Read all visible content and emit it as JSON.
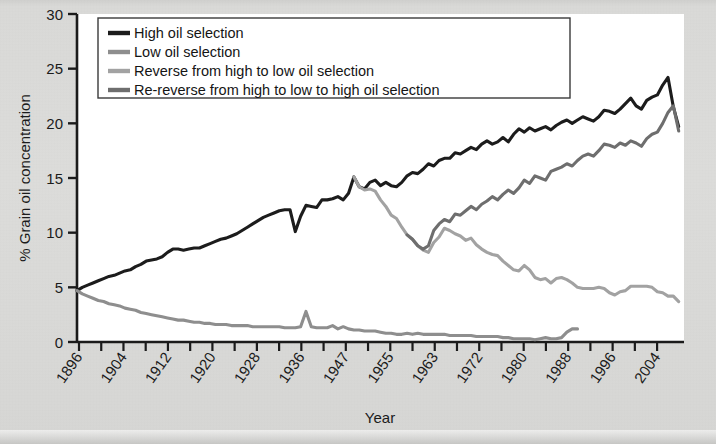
{
  "figure": {
    "background_color": "#d9d9d7",
    "plot_background_color": "#ffffff",
    "axis_color": "#1b1b1b"
  },
  "chart_data": {
    "type": "line",
    "title": "",
    "xlabel": "Year",
    "ylabel": "% Grain oil concentration",
    "xlim": [
      1896,
      2010
    ],
    "ylim": [
      0,
      30
    ],
    "yticks": [
      0,
      5,
      10,
      15,
      20,
      25,
      30
    ],
    "xticks": [
      1896,
      1904,
      1912,
      1920,
      1928,
      1936,
      1947,
      1955,
      1963,
      1972,
      1980,
      1988,
      1996,
      2004
    ],
    "grid": false,
    "legend_position": "top-left",
    "colors": {
      "high_oil_selection": "#1c1c1c",
      "low_oil_selection": "#8e8e8e",
      "reverse_high_to_low": "#a2a2a2",
      "re_reverse_high_low_high": "#6e6e6e"
    },
    "series": [
      {
        "name": "High oil selection",
        "color": "#1c1c1c",
        "stroke_width": 3.1,
        "x": [
          1896,
          1897,
          1898,
          1899,
          1900,
          1901,
          1902,
          1903,
          1904,
          1905,
          1906,
          1907,
          1908,
          1909,
          1910,
          1911,
          1912,
          1913,
          1914,
          1915,
          1916,
          1917,
          1918,
          1919,
          1920,
          1921,
          1922,
          1923,
          1924,
          1925,
          1926,
          1927,
          1928,
          1929,
          1930,
          1931,
          1932,
          1933,
          1934,
          1935,
          1936,
          1937,
          1938,
          1939,
          1940,
          1941,
          1942,
          1943,
          1944,
          1945,
          1946,
          1947,
          1948,
          1949,
          1950,
          1951,
          1952,
          1953,
          1954,
          1955,
          1956,
          1957,
          1958,
          1959,
          1960,
          1961,
          1962,
          1963,
          1964,
          1965,
          1966,
          1967,
          1968,
          1969,
          1970,
          1971,
          1972,
          1973,
          1974,
          1975,
          1976,
          1977,
          1978,
          1979,
          1980,
          1981,
          1982,
          1983,
          1984,
          1985,
          1986,
          1987,
          1988,
          1989,
          1990,
          1991,
          1992,
          1993,
          1994,
          1995,
          1996,
          1997,
          1998,
          1999,
          2000,
          2001,
          2002,
          2003,
          2004,
          2005,
          2006,
          2007,
          2008,
          2009
        ],
        "values": [
          4.7,
          5.0,
          5.2,
          5.4,
          5.6,
          5.8,
          6.0,
          6.1,
          6.3,
          6.5,
          6.6,
          6.9,
          7.1,
          7.4,
          7.5,
          7.6,
          7.8,
          8.2,
          8.5,
          8.5,
          8.4,
          8.5,
          8.6,
          8.6,
          8.8,
          9.0,
          9.2,
          9.4,
          9.5,
          9.7,
          9.9,
          10.2,
          10.5,
          10.8,
          11.1,
          11.4,
          11.6,
          11.8,
          12.0,
          12.1,
          12.1,
          10.1,
          11.5,
          12.5,
          12.4,
          12.3,
          13.0,
          13.0,
          13.1,
          13.3,
          13.0,
          13.6,
          15.1,
          14.2,
          14.0,
          14.6,
          14.8,
          14.3,
          14.6,
          14.3,
          14.2,
          14.6,
          15.2,
          15.5,
          15.4,
          15.8,
          16.3,
          16.1,
          16.6,
          16.8,
          16.8,
          17.3,
          17.2,
          17.5,
          17.8,
          17.6,
          18.1,
          18.4,
          18.1,
          18.3,
          18.7,
          18.3,
          19.0,
          19.5,
          19.2,
          19.6,
          19.3,
          19.5,
          19.7,
          19.4,
          19.8,
          20.1,
          20.3,
          20.0,
          20.3,
          20.6,
          20.4,
          20.2,
          20.6,
          21.2,
          21.1,
          20.9,
          21.3,
          21.8,
          22.3,
          21.6,
          21.3,
          22.1,
          22.4,
          22.6,
          23.5,
          24.2,
          21.5,
          19.7
        ]
      },
      {
        "name": "Low oil selection",
        "color": "#8e8e8e",
        "stroke_width": 3.1,
        "x": [
          1896,
          1897,
          1898,
          1899,
          1900,
          1901,
          1902,
          1903,
          1904,
          1905,
          1906,
          1907,
          1908,
          1909,
          1910,
          1911,
          1912,
          1913,
          1914,
          1915,
          1916,
          1917,
          1918,
          1919,
          1920,
          1921,
          1922,
          1923,
          1924,
          1925,
          1926,
          1927,
          1928,
          1929,
          1930,
          1931,
          1932,
          1933,
          1934,
          1935,
          1936,
          1937,
          1938,
          1939,
          1940,
          1941,
          1942,
          1943,
          1944,
          1945,
          1946,
          1947,
          1948,
          1949,
          1950,
          1951,
          1952,
          1953,
          1954,
          1955,
          1956,
          1957,
          1958,
          1959,
          1960,
          1961,
          1962,
          1963,
          1964,
          1965,
          1966,
          1967,
          1968,
          1969,
          1970,
          1971,
          1972,
          1973,
          1974,
          1975,
          1976,
          1977,
          1978,
          1979,
          1980,
          1981,
          1982,
          1983,
          1984,
          1985,
          1986,
          1987,
          1988,
          1989,
          1990
        ],
        "values": [
          4.7,
          4.4,
          4.2,
          4.0,
          3.8,
          3.7,
          3.5,
          3.4,
          3.3,
          3.1,
          3.0,
          2.9,
          2.7,
          2.6,
          2.5,
          2.4,
          2.3,
          2.2,
          2.1,
          2.0,
          2.0,
          1.9,
          1.8,
          1.8,
          1.7,
          1.7,
          1.6,
          1.6,
          1.6,
          1.5,
          1.5,
          1.5,
          1.5,
          1.4,
          1.4,
          1.4,
          1.4,
          1.4,
          1.4,
          1.3,
          1.3,
          1.3,
          1.4,
          2.8,
          1.4,
          1.3,
          1.3,
          1.3,
          1.5,
          1.2,
          1.4,
          1.2,
          1.1,
          1.1,
          1.0,
          1.0,
          1.0,
          0.9,
          0.8,
          0.8,
          0.7,
          0.7,
          0.8,
          0.7,
          0.8,
          0.7,
          0.7,
          0.7,
          0.7,
          0.7,
          0.6,
          0.6,
          0.6,
          0.6,
          0.6,
          0.5,
          0.5,
          0.5,
          0.5,
          0.5,
          0.4,
          0.4,
          0.3,
          0.3,
          0.3,
          0.3,
          0.2,
          0.3,
          0.4,
          0.3,
          0.3,
          0.4,
          0.9,
          1.2,
          1.2
        ]
      },
      {
        "name": "Reverse from high to low oil selection",
        "color": "#a2a2a2",
        "stroke_width": 3.1,
        "x": [
          1948,
          1949,
          1950,
          1951,
          1952,
          1953,
          1954,
          1955,
          1956,
          1957,
          1958,
          1959,
          1960,
          1961,
          1962,
          1963,
          1964,
          1965,
          1966,
          1967,
          1968,
          1969,
          1970,
          1971,
          1972,
          1973,
          1974,
          1975,
          1976,
          1977,
          1978,
          1979,
          1980,
          1981,
          1982,
          1983,
          1984,
          1985,
          1986,
          1987,
          1988,
          1989,
          1990,
          1991,
          1992,
          1993,
          1994,
          1995,
          1996,
          1997,
          1998,
          1999,
          2000,
          2001,
          2002,
          2003,
          2004,
          2005,
          2006,
          2007,
          2008,
          2009
        ],
        "values": [
          15.1,
          14.2,
          13.9,
          14.0,
          13.8,
          13.0,
          12.4,
          11.6,
          11.3,
          10.5,
          9.8,
          9.4,
          8.8,
          8.4,
          8.2,
          9.1,
          9.6,
          10.4,
          10.2,
          9.9,
          9.7,
          9.3,
          9.5,
          8.9,
          8.5,
          8.2,
          8.0,
          7.9,
          7.4,
          7.0,
          6.6,
          6.5,
          7.0,
          6.6,
          5.9,
          5.7,
          5.8,
          5.4,
          5.8,
          5.9,
          5.7,
          5.4,
          5.0,
          4.9,
          4.9,
          4.9,
          5.0,
          4.9,
          4.5,
          4.3,
          4.6,
          4.7,
          5.1,
          5.1,
          5.1,
          5.1,
          5.0,
          4.6,
          4.5,
          4.2,
          4.2,
          3.7
        ]
      },
      {
        "name": "Re-reverse from high to low to high oil selection",
        "color": "#6e6e6e",
        "stroke_width": 3.1,
        "x": [
          1958,
          1959,
          1960,
          1961,
          1962,
          1963,
          1964,
          1965,
          1966,
          1967,
          1968,
          1969,
          1970,
          1971,
          1972,
          1973,
          1974,
          1975,
          1976,
          1977,
          1978,
          1979,
          1980,
          1981,
          1982,
          1983,
          1984,
          1985,
          1986,
          1987,
          1988,
          1989,
          1990,
          1991,
          1992,
          1993,
          1994,
          1995,
          1996,
          1997,
          1998,
          1999,
          2000,
          2001,
          2002,
          2003,
          2004,
          2005,
          2006,
          2007,
          2008,
          2009
        ],
        "values": [
          9.8,
          9.4,
          8.8,
          8.5,
          8.8,
          10.2,
          10.8,
          11.2,
          11.0,
          11.7,
          11.6,
          12.0,
          12.4,
          12.1,
          12.6,
          12.9,
          13.3,
          13.0,
          13.5,
          13.9,
          13.6,
          14.1,
          14.8,
          14.5,
          15.2,
          15.0,
          14.8,
          15.6,
          15.8,
          16.0,
          16.3,
          16.1,
          16.6,
          17.0,
          17.2,
          17.0,
          17.5,
          18.1,
          18.0,
          17.8,
          18.2,
          18.0,
          18.4,
          18.2,
          17.9,
          18.6,
          19.0,
          19.2,
          20.0,
          21.0,
          21.6,
          19.3
        ]
      }
    ]
  },
  "legend": {
    "items": [
      {
        "label": "High oil selection",
        "color": "#1c1c1c"
      },
      {
        "label": "Low oil selection",
        "color": "#8e8e8e"
      },
      {
        "label": "Reverse from high to low oil selection",
        "color": "#a2a2a2"
      },
      {
        "label": "Re-reverse from high to low to high oil selection",
        "color": "#6e6e6e"
      }
    ]
  }
}
